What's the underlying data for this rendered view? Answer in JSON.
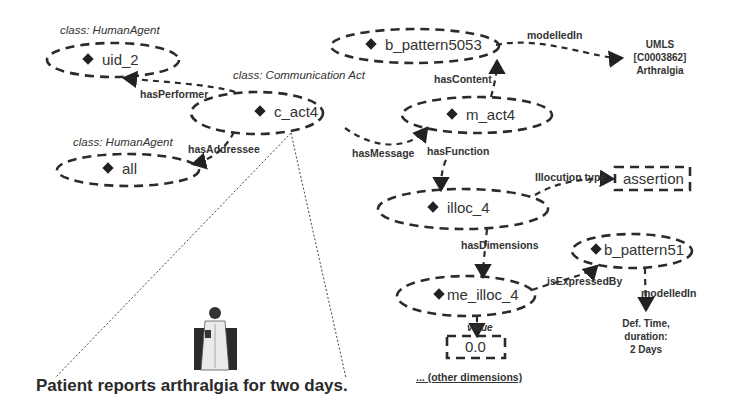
{
  "diagram": {
    "caption": "Patient reports arthralgia for two days.",
    "nodes": {
      "uid_2": {
        "label": "uid_2",
        "class": "class: HumanAgent"
      },
      "all": {
        "label": "all",
        "class": "class: HumanAgent"
      },
      "c_act4": {
        "label": "c_act4",
        "class": "class: Communication Act"
      },
      "b_pattern5053": {
        "label": "b_pattern5053"
      },
      "m_act4": {
        "label": "m_act4"
      },
      "illoc_4": {
        "label": "illoc_4"
      },
      "b_pattern51": {
        "label": "b_pattern51"
      },
      "me_illoc_4": {
        "label": "me_illoc_4"
      }
    },
    "literals": {
      "assertion": "assertion",
      "value": "0.0"
    },
    "external": {
      "umls_line1": "UMLS",
      "umls_line2": "[C0003862]",
      "umls_line3": "Arthralgia",
      "deftime_line1": "Def. Time,",
      "deftime_line2": "duration:",
      "deftime_line3": "2 Days"
    },
    "edges": {
      "hasPerformer": "hasPerformer",
      "hasAddressee": "hasAddressee",
      "hasMessage": "hasMessage",
      "hasContent": "hasContent",
      "modelledIn_1": "modelledIn",
      "hasFunction": "hasFunction",
      "illocutionType": "Illocution type",
      "hasDimensions": "hasDimensions",
      "isExpressedBy": "isExpressedBy",
      "modelledIn_2": "modelledIn",
      "value": "value"
    },
    "other_dimensions": "...  (other dimensions)",
    "icons": {
      "person": "doctor-person-icon",
      "instance": "diamond-icon"
    }
  }
}
